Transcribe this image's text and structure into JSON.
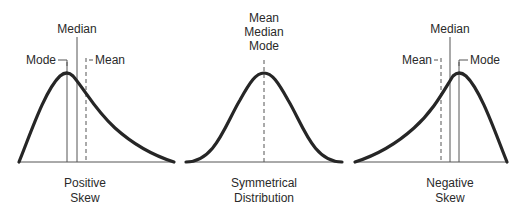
{
  "colors": {
    "curve": "#262626",
    "line": "#555555",
    "text": "#2a2a2a",
    "background": "#ffffff"
  },
  "panels": [
    {
      "id": "positive",
      "caption_line1": "Positive",
      "caption_line2": "Skew",
      "labels": {
        "mode": "Mode",
        "median": "Median",
        "mean": "Mean"
      }
    },
    {
      "id": "symmetric",
      "caption_line1": "Symmetrical",
      "caption_line2": "Distribution",
      "labels": {
        "line1": "Mean",
        "line2": "Median",
        "line3": "Mode"
      }
    },
    {
      "id": "negative",
      "caption_line1": "Negative",
      "caption_line2": "Skew",
      "labels": {
        "mean": "Mean",
        "median": "Median",
        "mode": "Mode"
      }
    }
  ]
}
